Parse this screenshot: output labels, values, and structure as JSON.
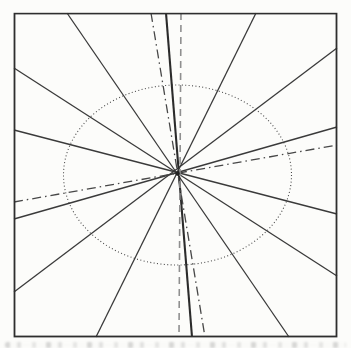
{
  "page": {
    "background_color": "#fcfcfa"
  },
  "figure": {
    "border": {
      "x": 14.5,
      "y": 13.5,
      "width": 322,
      "height": 323,
      "color": "#2e2e2e",
      "stroke_width": 1.8
    },
    "center": {
      "x": 177.5,
      "y": 173.5,
      "dot_radius": 2.2,
      "dot_color": "#222222"
    },
    "ellipse": {
      "name": "dotted-ellipse",
      "cx": 177.5,
      "cy": 175,
      "rx": 114,
      "ry": 90,
      "style": "dotted"
    },
    "line_styles": {
      "solid": {
        "color": "#3a3a3a",
        "width": 1.3,
        "dash": ""
      },
      "bold-solid": {
        "color": "#2b2b2b",
        "width": 2.1,
        "dash": ""
      },
      "dash-dot": {
        "color": "#474747",
        "width": 1.3,
        "dash": "9 4 1.5 4"
      },
      "dashed": {
        "color": "#8f8f8f",
        "width": 1.6,
        "dash": "7 5"
      },
      "dotted": {
        "color": "#4a4a4a",
        "width": 1.1,
        "dash": "1 2.4"
      }
    },
    "lines": [
      {
        "name": "solid-line-1",
        "style": "solid",
        "x1": 14,
        "y1": 68,
        "x2": 337,
        "y2": 276
      },
      {
        "name": "solid-line-2",
        "style": "solid",
        "x1": 14,
        "y1": 130,
        "x2": 337,
        "y2": 214
      },
      {
        "name": "solid-line-3",
        "style": "solid",
        "x1": 14,
        "y1": 219,
        "x2": 337,
        "y2": 127
      },
      {
        "name": "solid-line-4",
        "style": "solid",
        "x1": 14,
        "y1": 292,
        "x2": 337,
        "y2": 48
      },
      {
        "name": "solid-line-5",
        "style": "solid",
        "x1": 67,
        "y1": 13,
        "x2": 289,
        "y2": 337
      },
      {
        "name": "bold-vertical-line",
        "style": "bold-solid",
        "x1": 166,
        "y1": 13,
        "x2": 192,
        "y2": 337
      },
      {
        "name": "solid-line-7",
        "style": "solid",
        "x1": 256,
        "y1": 13,
        "x2": 96,
        "y2": 337
      },
      {
        "name": "dash-dot-line-steep",
        "style": "dash-dot",
        "x1": 151,
        "y1": 13,
        "x2": 205,
        "y2": 337
      },
      {
        "name": "dash-dot-line-shallow",
        "style": "dash-dot",
        "x1": 14,
        "y1": 202,
        "x2": 337,
        "y2": 145
      },
      {
        "name": "dashed-vertical-line",
        "style": "dashed",
        "x1": 181,
        "y1": 13,
        "x2": 179,
        "y2": 337
      }
    ],
    "caption_strip_present": true
  }
}
